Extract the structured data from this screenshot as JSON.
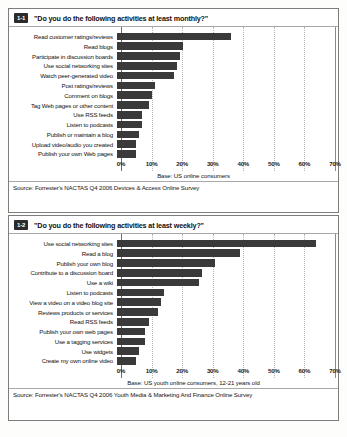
{
  "document": {
    "kind": "scanned-report-figure-pair"
  },
  "figures": [
    {
      "badge": "1-1",
      "title": "\"Do you do the following activities at least monthly?\"",
      "base_note": "Base: US online consumers",
      "source_note": "Source: Forrester's NACTAS Q4 2006 Devices & Access Online Survey",
      "chart_data": {
        "type": "bar",
        "orientation": "horizontal",
        "title": "\"Do you do the following activities at least monthly?\"",
        "xlabel": "",
        "ylabel": "",
        "xlim": [
          0,
          70
        ],
        "xticks": [
          "0%",
          "10%",
          "20%",
          "30%",
          "40%",
          "50%",
          "60%",
          "70%"
        ],
        "xtick_values": [
          0,
          10,
          20,
          30,
          40,
          50,
          60,
          70
        ],
        "grid": true,
        "legend": "none",
        "bar_color": "#3a3a3a",
        "categories": [
          "Read customer ratings/reviews",
          "Read blogs",
          "Participate in discussion boards",
          "Use social networking sites",
          "Watch peer-generated video",
          "Post ratings/reviews",
          "Comment on blogs",
          "Tag Web pages or other content",
          "Use RSS feeds",
          "Listen to podcasts",
          "Publish or maintain a blog",
          "Upload video/audio you created",
          "Publish your own Web pages"
        ],
        "values": [
          36,
          21,
          20,
          19,
          18,
          12,
          11,
          10,
          8,
          8,
          7,
          6,
          6
        ]
      }
    },
    {
      "badge": "1-2",
      "title": "\"Do you do the following activities at least weekly?\"",
      "base_note": "Base: US youth online consumers, 12-21 years old",
      "source_note": "Source: Forrester's NACTAS Q4 2006 Youth Media & Marketing And Finance Online Survey",
      "chart_data": {
        "type": "bar",
        "orientation": "horizontal",
        "title": "\"Do you do the following activities at least weekly?\"",
        "xlabel": "",
        "ylabel": "",
        "xlim": [
          0,
          70
        ],
        "xticks": [
          "0%",
          "10%",
          "20%",
          "30%",
          "40%",
          "50%",
          "60%",
          "70%"
        ],
        "xtick_values": [
          0,
          10,
          20,
          30,
          40,
          50,
          60,
          70
        ],
        "grid": true,
        "legend": "none",
        "bar_color": "#3a3a3a",
        "categories": [
          "Use social networking sites",
          "Read a blog",
          "Publish your own blog",
          "Contribute to a discussion board",
          "Use a wiki",
          "Listen to podcasts",
          "View a video on a video blog site",
          "Reviews products or services",
          "Read RSS feeds",
          "Publish your own web pages",
          "Use a tagging services",
          "Use widgets",
          "Create my own online video"
        ],
        "values": [
          63,
          39,
          31,
          27,
          26,
          15,
          14,
          13,
          10,
          9,
          9,
          7,
          6
        ]
      }
    }
  ]
}
